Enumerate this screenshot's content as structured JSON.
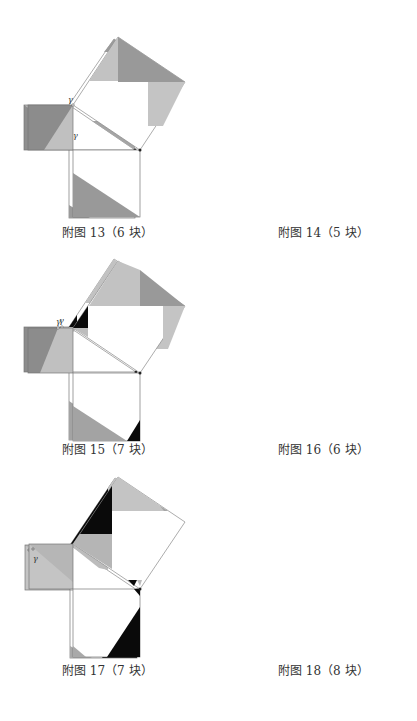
{
  "figures": [
    {
      "id": 13,
      "caption": "附图 13（6 块）",
      "pieces": 6,
      "point_label": "γ"
    },
    {
      "id": 14,
      "caption": "附图 14（5 块）",
      "pieces": 5,
      "point_label": "γ"
    },
    {
      "id": 15,
      "caption": "附图 15（7 块）",
      "pieces": 7,
      "point_label": "γ"
    },
    {
      "id": 16,
      "caption": "附图 16（6 块）",
      "pieces": 6,
      "point_label": "γ"
    },
    {
      "id": 17,
      "caption": "附图 17（7 块）",
      "pieces": 7,
      "point_label": "γ"
    },
    {
      "id": 18,
      "caption": "附图 18（8 块）",
      "pieces": 8,
      "point_label": "γ"
    }
  ],
  "colors": {
    "dark_gray": "#8c8c8c",
    "mid_gray": "#a9a9a9",
    "light_gray": "#c4c4c4",
    "black": "#0a0a0a",
    "outline": "#777777",
    "white": "#ffffff"
  }
}
